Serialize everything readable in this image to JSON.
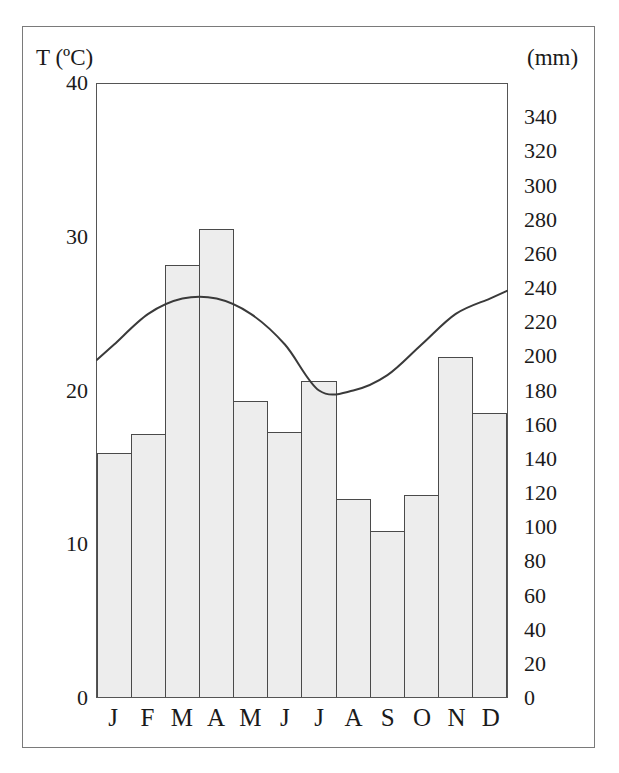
{
  "figure": {
    "temperature_axis_caption": "T (ºC)",
    "precipitation_axis_caption": "(mm)"
  },
  "chart_data": {
    "type": "bar",
    "title": "",
    "subtitle": "",
    "xlabel": "",
    "ylabel": "T (ºC)",
    "y2label": "(mm)",
    "grid": false,
    "legend": "none",
    "categories": [
      "J",
      "F",
      "M",
      "A",
      "M",
      "J",
      "J",
      "A",
      "S",
      "O",
      "N",
      "D"
    ],
    "month_labels": [
      "J",
      "F",
      "M",
      "A",
      "M",
      "J",
      "J",
      "A",
      "S",
      "O",
      "N",
      "D"
    ],
    "series": [
      {
        "name": "Precipitation",
        "type": "bar",
        "unit": "mm",
        "axis": "right",
        "values": [
          143,
          154,
          253,
          274,
          173,
          155,
          185,
          116,
          97,
          118,
          199,
          166
        ]
      },
      {
        "name": "Temperature",
        "type": "line",
        "unit": "ºC",
        "axis": "left",
        "values": [
          23,
          25,
          26,
          26,
          25,
          23,
          20,
          20,
          21,
          23,
          25,
          26
        ]
      }
    ],
    "ylim": [
      0,
      40
    ],
    "y2lim": [
      0,
      360
    ],
    "yticks": [
      0,
      10,
      20,
      30,
      40
    ],
    "y2ticks": [
      0,
      20,
      40,
      60,
      80,
      100,
      120,
      140,
      160,
      180,
      200,
      220,
      240,
      260,
      280,
      300,
      320,
      340
    ],
    "ytick_labels": [
      "0",
      "10",
      "20",
      "30",
      "40"
    ],
    "y2tick_labels": [
      "0",
      "20",
      "40",
      "60",
      "80",
      "100",
      "120",
      "140",
      "160",
      "180",
      "200",
      "220",
      "240",
      "260",
      "280",
      "300",
      "320",
      "340"
    ],
    "colors": {
      "bar_fill": "#ededed",
      "bar_stroke": "#4a4a4a",
      "line_stroke": "#3a3a3a",
      "frame": "#7a7a7a",
      "text": "#1a1a1a"
    }
  }
}
